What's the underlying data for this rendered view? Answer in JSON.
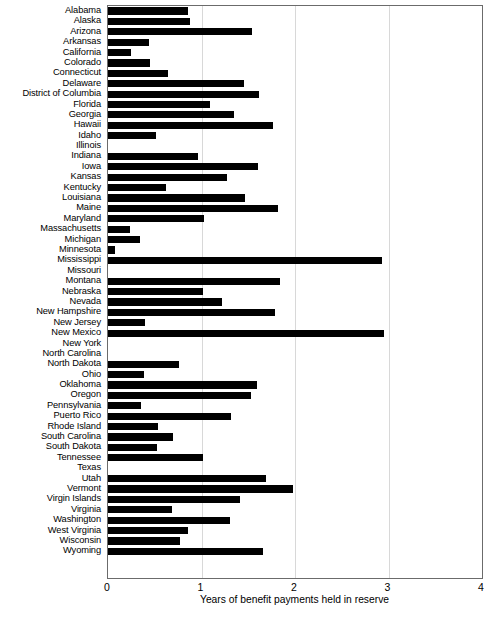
{
  "chart_data": {
    "type": "bar",
    "orientation": "horizontal",
    "title": "",
    "xlabel": "Years of benefit payments held in reserve",
    "ylabel": "",
    "xlim": [
      0,
      4
    ],
    "xticks": [
      "0",
      "1",
      "2",
      "3",
      "4"
    ],
    "grid": "vertical gridlines at 1, 2, 3",
    "legend": "none",
    "categories": [
      "Alabama",
      "Alaska",
      "Arizona",
      "Arkansas",
      "California",
      "Colorado",
      "Connecticut",
      "Delaware",
      "District of Columbia",
      "Florida",
      "Georgia",
      "Hawaii",
      "Idaho",
      "Illinois",
      "Indiana",
      "Iowa",
      "Kansas",
      "Kentucky",
      "Louisiana",
      "Maine",
      "Maryland",
      "Massachusetts",
      "Michigan",
      "Minnesota",
      "Mississippi",
      "Missouri",
      "Montana",
      "Nebraska",
      "Nevada",
      "New Hampshire",
      "New Jersey",
      "New Mexico",
      "New York",
      "North Carolina",
      "North Dakota",
      "Ohio",
      "Oklahoma",
      "Oregon",
      "Pennsylvania",
      "Puerto Rico",
      "Rhode Island",
      "South Carolina",
      "South Dakota",
      "Tennessee",
      "Texas",
      "Utah",
      "Vermont",
      "Virgin Islands",
      "Virginia",
      "Washington",
      "West Virginia",
      "Wisconsin",
      "Wyoming"
    ],
    "values": [
      0.86,
      0.88,
      1.54,
      0.44,
      0.25,
      0.45,
      0.64,
      1.45,
      1.61,
      1.09,
      1.35,
      1.77,
      0.51,
      0.0,
      0.96,
      1.6,
      1.27,
      0.62,
      1.46,
      1.82,
      1.03,
      0.24,
      0.34,
      0.07,
      2.93,
      0.0,
      1.84,
      1.02,
      1.22,
      1.79,
      0.4,
      2.95,
      0.0,
      0.0,
      0.76,
      0.38,
      1.59,
      1.53,
      0.35,
      1.32,
      0.53,
      0.69,
      0.52,
      1.02,
      0.0,
      1.69,
      1.98,
      1.41,
      0.68,
      1.3,
      0.86,
      0.77,
      1.66
    ],
    "bar_color": "#000000"
  },
  "axis": {
    "x_title": "Years of benefit payments held in reserve",
    "ticks": [
      "0",
      "1",
      "2",
      "3",
      "4"
    ]
  }
}
